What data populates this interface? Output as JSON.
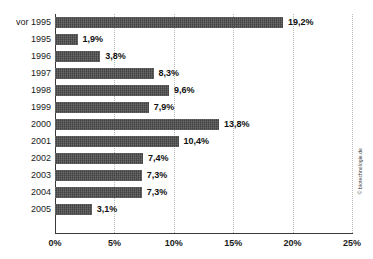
{
  "chart_data": {
    "type": "bar",
    "orientation": "horizontal",
    "title": "",
    "subtitle": "",
    "xlabel": "",
    "ylabel": "",
    "categories": [
      "vor 1995",
      "1995",
      "1996",
      "1997",
      "1998",
      "1999",
      "2000",
      "2001",
      "2002",
      "2003",
      "2004",
      "2005"
    ],
    "values": [
      19.2,
      1.9,
      3.8,
      8.3,
      9.6,
      7.9,
      13.8,
      10.4,
      7.4,
      7.3,
      7.3,
      3.1
    ],
    "value_labels": [
      "19,2%",
      "1,9%",
      "3,8%",
      "8,3%",
      "9,6%",
      "7,9%",
      "13,8%",
      "10,4%",
      "7,4%",
      "7,3%",
      "7,3%",
      "3,1%"
    ],
    "xlim": [
      0,
      25
    ],
    "xticks": [
      0,
      5,
      10,
      15,
      20,
      25
    ],
    "xtick_labels": [
      "0%",
      "5%",
      "10%",
      "15%",
      "20%",
      "25%"
    ],
    "grid": "vertical-dotted",
    "legend": "none",
    "bar_color": "#4a4a4a",
    "gridline_color": "#b8b8b8",
    "axis_color": "#3a3a3a",
    "label_color": "#111111"
  },
  "credit": {
    "text": "© biotechnologie.de"
  }
}
